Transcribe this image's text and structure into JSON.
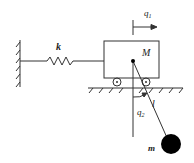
{
  "diagram": {
    "labels": {
      "spring_constant": "k",
      "cart_mass": "M",
      "cart_displacement": "q",
      "cart_displacement_sub": "1",
      "pendulum_angle": "q",
      "pendulum_angle_sub": "2",
      "pendulum_length": "l",
      "pendulum_mass": "m"
    },
    "colors": {
      "stroke": "#333333",
      "mass_fill": "#000000",
      "background": "#ffffff"
    }
  }
}
